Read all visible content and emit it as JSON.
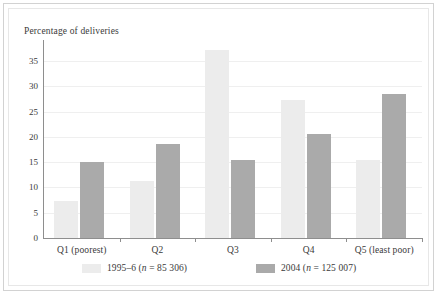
{
  "chart_data": {
    "type": "bar",
    "title": "Percentage of deliveries",
    "xlabel": "",
    "ylabel": "Percentage of deliveries",
    "ylim": [
      0,
      38
    ],
    "yticks": [
      0,
      5,
      10,
      15,
      20,
      25,
      30,
      35
    ],
    "ytick_labels": [
      "0",
      "5",
      "10",
      "15",
      "20",
      "25",
      "30",
      "35"
    ],
    "grid": true,
    "legend_position": "bottom",
    "categories": [
      "Q1 (poorest)",
      "Q2",
      "Q3",
      "Q4",
      "Q5 (least poor)"
    ],
    "series": [
      {
        "name": "1995–6 (n = 85 306)",
        "color": "#ececec",
        "values": [
          7.3,
          11.2,
          37.3,
          27.3,
          15.4
        ]
      },
      {
        "name": "2004 (n = 125 007)",
        "color": "#aaaaaa",
        "values": [
          15.0,
          18.7,
          15.4,
          20.5,
          28.6
        ]
      }
    ]
  },
  "legend": {
    "items": [
      {
        "label_prefix": "1995–6 (",
        "label_italic": "n",
        "label_suffix": " = 85 306)",
        "full": "1995–6 (n = 85 306)",
        "color": "#ececec"
      },
      {
        "label_prefix": "2004 (",
        "label_italic": "n",
        "label_suffix": " = 125 007)",
        "full": "2004 (n = 125 007)",
        "color": "#aaaaaa"
      }
    ]
  },
  "colors": {
    "series_a": "#ececec",
    "series_b": "#aaaaaa",
    "axis": "#8e8e8e",
    "gridline": "#efefef",
    "text": "#3a3a3a",
    "frame": "#d2d2d2"
  }
}
